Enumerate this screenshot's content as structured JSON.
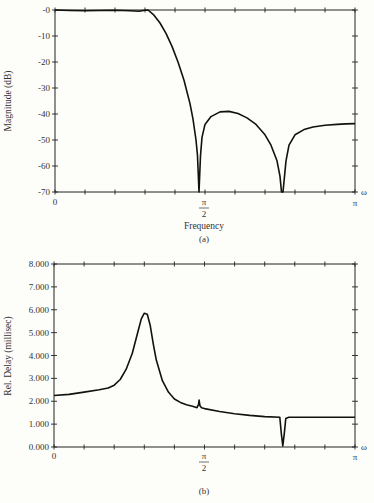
{
  "chart_data": [
    {
      "id": "a",
      "type": "line",
      "caption": "(a)",
      "title": "",
      "xlabel": "Frequency",
      "ylabel": "Magnitude (dB)",
      "x_unit": "ω (fraction of π)",
      "xlim": [
        0,
        1
      ],
      "ylim": [
        -70,
        0
      ],
      "x_tick_labels": [
        {
          "x": 0,
          "label": "0"
        },
        {
          "x": 0.5,
          "label": "π/2"
        },
        {
          "x": 1,
          "label": "π"
        }
      ],
      "x_axis_symbol": "ω",
      "y_ticks": [
        0,
        -10,
        -20,
        -30,
        -40,
        -50,
        -60,
        -70
      ],
      "y_tick_labels": [
        "-0",
        "-10",
        "-20",
        "-30",
        "-40",
        "-50",
        "-60",
        "-70"
      ],
      "grid": false,
      "x_minor_ticks": 10,
      "series": [
        {
          "name": "Magnitude",
          "x": [
            0,
            0.05,
            0.1,
            0.15,
            0.2,
            0.25,
            0.28,
            0.3,
            0.31,
            0.33,
            0.35,
            0.37,
            0.39,
            0.41,
            0.43,
            0.45,
            0.46,
            0.47,
            0.475,
            0.48,
            0.485,
            0.49,
            0.5,
            0.52,
            0.55,
            0.58,
            0.61,
            0.64,
            0.67,
            0.7,
            0.72,
            0.74,
            0.75,
            0.755,
            0.76,
            0.765,
            0.77,
            0.78,
            0.8,
            0.83,
            0.86,
            0.9,
            0.94,
            0.97,
            1.0
          ],
          "y": [
            0,
            -0.2,
            -0.3,
            -0.2,
            -0.1,
            -0.3,
            -0.5,
            -0.1,
            0,
            -2,
            -5,
            -9,
            -14,
            -20,
            -27,
            -36,
            -42,
            -50,
            -56,
            -70,
            -56,
            -49,
            -44,
            -41,
            -39.2,
            -39,
            -39.8,
            -41.5,
            -44,
            -48,
            -52,
            -58,
            -64,
            -70,
            -70,
            -64,
            -58,
            -52,
            -48,
            -46,
            -45,
            -44.3,
            -44,
            -43.8,
            -43.7
          ]
        }
      ]
    },
    {
      "id": "b",
      "type": "line",
      "caption": "(b)",
      "title": "",
      "xlabel": "",
      "ylabel": "Rel. Delay (millisec)",
      "x_unit": "ω (fraction of π)",
      "xlim": [
        0,
        1
      ],
      "ylim": [
        0,
        8
      ],
      "x_tick_labels": [
        {
          "x": 0,
          "label": "0"
        },
        {
          "x": 0.5,
          "label": "π/2"
        },
        {
          "x": 1,
          "label": "π"
        }
      ],
      "x_axis_symbol": "ω",
      "y_ticks": [
        0,
        1,
        2,
        3,
        4,
        5,
        6,
        7,
        8
      ],
      "y_tick_labels": [
        "0.000",
        "1.000",
        "2.000",
        "3.000",
        "4.000",
        "5.000",
        "6.000",
        "7.000",
        "8.000"
      ],
      "grid": false,
      "x_minor_ticks": 10,
      "series": [
        {
          "name": "Relative group delay",
          "x": [
            0,
            0.05,
            0.1,
            0.15,
            0.18,
            0.2,
            0.22,
            0.24,
            0.26,
            0.27,
            0.28,
            0.29,
            0.3,
            0.31,
            0.32,
            0.33,
            0.34,
            0.36,
            0.38,
            0.4,
            0.42,
            0.44,
            0.46,
            0.475,
            0.48,
            0.482,
            0.485,
            0.49,
            0.5,
            0.55,
            0.6,
            0.65,
            0.7,
            0.75,
            0.755,
            0.76,
            0.765,
            0.77,
            0.78,
            0.8,
            0.85,
            0.9,
            0.95,
            1.0
          ],
          "y": [
            2.25,
            2.3,
            2.4,
            2.5,
            2.58,
            2.7,
            2.95,
            3.4,
            4.1,
            4.6,
            5.1,
            5.6,
            5.85,
            5.8,
            5.3,
            4.5,
            3.8,
            2.9,
            2.4,
            2.1,
            1.95,
            1.85,
            1.78,
            1.72,
            1.85,
            2.05,
            1.8,
            1.72,
            1.68,
            1.55,
            1.45,
            1.38,
            1.33,
            1.3,
            0.6,
            0.05,
            0.6,
            1.25,
            1.3,
            1.3,
            1.3,
            1.3,
            1.3,
            1.3
          ]
        }
      ]
    }
  ],
  "figure": {
    "chart_a": {
      "ylabel": "Magnitude (dB)",
      "xlabel": "Frequency",
      "caption": "(a)",
      "x_zero": "0",
      "x_half": "π",
      "x_half_den": "2",
      "x_pi": "π",
      "omega": "ω"
    },
    "chart_b": {
      "ylabel": "Rel. Delay (millisec)",
      "caption": "(b)",
      "x_zero": "0",
      "x_half": "π",
      "x_half_den": "2",
      "x_pi": "π",
      "omega": "ω"
    }
  }
}
